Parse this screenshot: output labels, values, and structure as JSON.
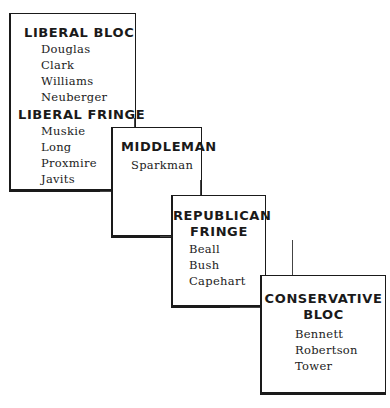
{
  "diagram": {
    "groups": [
      {
        "heading": "LIBERAL BLOC",
        "members": [
          "Douglas",
          "Clark",
          "Williams",
          "Neuberger"
        ],
        "subheading": "LIBERAL FRINGE",
        "sub_members": [
          "Muskie",
          "Long",
          "Proxmire",
          "Javits"
        ]
      },
      {
        "heading": "MIDDLEMAN",
        "members": [
          "Sparkman"
        ]
      },
      {
        "heading_line1": "REPUBLICAN",
        "heading_line2": "FRINGE",
        "members": [
          "Beall",
          "Bush",
          "Capehart"
        ]
      },
      {
        "heading_line1": "CONSERVATIVE",
        "heading_line2": "BLOC",
        "members": [
          "Bennett",
          "Robertson",
          "Tower"
        ]
      }
    ]
  }
}
